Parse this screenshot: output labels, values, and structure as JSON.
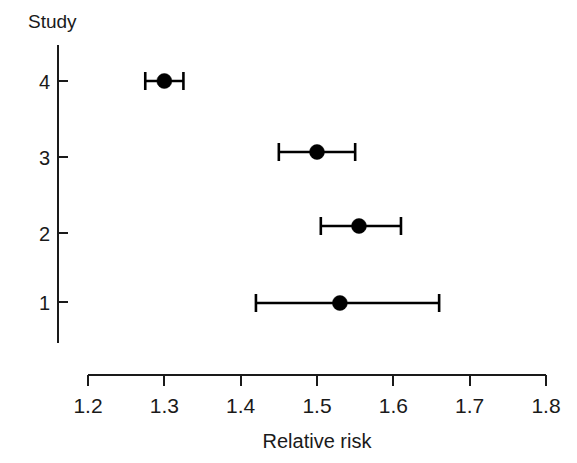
{
  "chart_data": {
    "type": "scatter",
    "subtype": "forest-plot",
    "title": "",
    "xlabel": "Relative risk",
    "ylabel": "Study",
    "xlim": [
      1.2,
      1.8
    ],
    "xticks": [
      1.2,
      1.3,
      1.4,
      1.5,
      1.6,
      1.7,
      1.8
    ],
    "xtick_labels": [
      "1.2",
      "1.3",
      "1.4",
      "1.5",
      "1.6",
      "1.7",
      "1.8"
    ],
    "yticks": [
      1,
      2,
      3,
      4
    ],
    "ytick_labels": [
      "1",
      "2",
      "3",
      "4"
    ],
    "grid": false,
    "legend": "none",
    "series": [
      {
        "name": "Relative risk with 95% CI",
        "points": [
          {
            "study": "4",
            "estimate": 1.3,
            "ci_low": 1.275,
            "ci_high": 1.325
          },
          {
            "study": "3",
            "estimate": 1.5,
            "ci_low": 1.45,
            "ci_high": 1.55
          },
          {
            "study": "2",
            "estimate": 1.555,
            "ci_low": 1.505,
            "ci_high": 1.61
          },
          {
            "study": "1",
            "estimate": 1.53,
            "ci_low": 1.42,
            "ci_high": 1.66
          }
        ]
      }
    ]
  },
  "axes": {
    "y_axis_title": "Study",
    "x_axis_title": "Relative risk"
  },
  "colors": {
    "marker": "#000000",
    "axis": "#1a1a1a",
    "background": "#ffffff"
  }
}
